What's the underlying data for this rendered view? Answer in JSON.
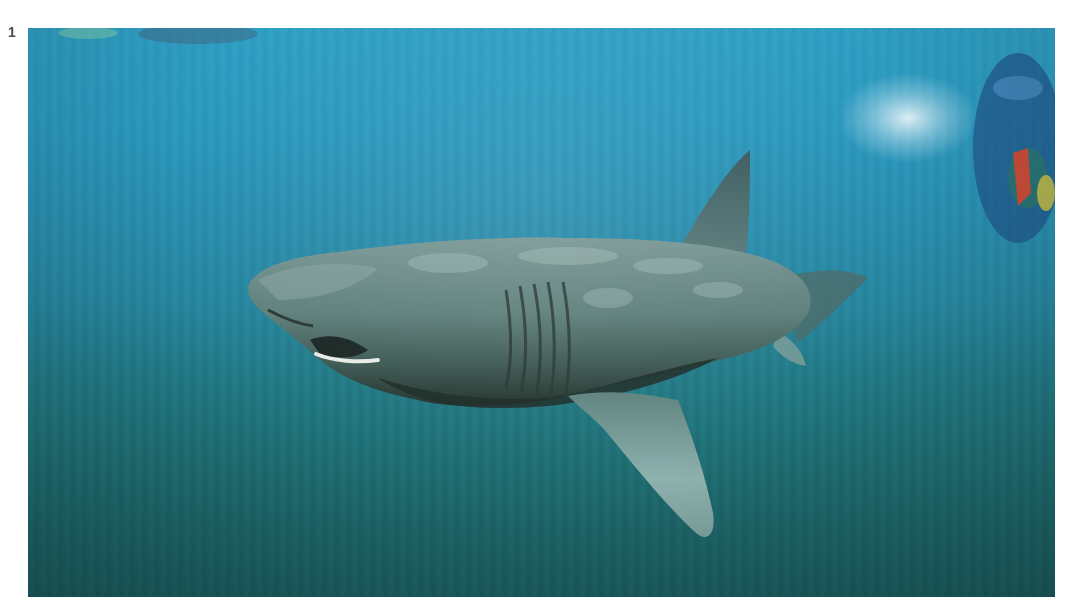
{
  "figure": {
    "number": "1",
    "image": {
      "subject": "basking shark swimming underwater",
      "description": "Large basking shark viewed from the side, swimming left, mouth slightly open, gill slits visible; diver with red and yellow gear at upper right near the surface.",
      "colors": {
        "water_top": "#2f9fc4",
        "water_bottom": "#1b5d60",
        "shark_body": "#5e7f7d",
        "shark_belly_shadow": "#2a3b36",
        "fin": "#6f918f",
        "diver_red": "#d9452b",
        "diver_yellow": "#d9c63a"
      }
    }
  }
}
